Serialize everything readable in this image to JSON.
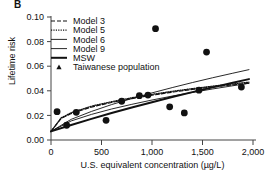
{
  "panel": {
    "label": "B"
  },
  "axes": {
    "ylabel": "Lifetime risk",
    "xlabel": "U.S. equivalent concentration (µg/L)",
    "yticks": [
      "0.00",
      "0.02",
      "0.04",
      "0.06",
      "0.08",
      "0.10"
    ],
    "xticks": [
      "0",
      "500",
      "1,000",
      "1,500",
      "2,000"
    ]
  },
  "legend": {
    "items": [
      {
        "label": "Model 3",
        "style": "dashed"
      },
      {
        "label": "Model 5",
        "style": "dotted"
      },
      {
        "label": "Model 6",
        "style": "thin-solid"
      },
      {
        "label": "Model 9",
        "style": "thin-solid"
      },
      {
        "label": "MSW",
        "style": "thick-solid"
      },
      {
        "label": "Taiwanese population",
        "style": "marker-triangle"
      }
    ]
  },
  "chart_data": {
    "type": "scatter",
    "title": "B",
    "xlabel": "U.S. equivalent concentration (µg/L)",
    "ylabel": "Lifetime risk",
    "xlim": [
      0,
      2000
    ],
    "ylim": [
      0.0,
      0.1
    ],
    "xticks": [
      0,
      500,
      1000,
      1500,
      2000
    ],
    "yticks": [
      0.0,
      0.02,
      0.04,
      0.06,
      0.08,
      0.1
    ],
    "grid": false,
    "legend_position": "upper-left",
    "scatter": {
      "name": "Taiwanese population",
      "marker": "circle",
      "color": "#111111",
      "points": [
        {
          "x": 60,
          "y": 0.023
        },
        {
          "x": 155,
          "y": 0.012
        },
        {
          "x": 250,
          "y": 0.0225
        },
        {
          "x": 545,
          "y": 0.016
        },
        {
          "x": 700,
          "y": 0.0315
        },
        {
          "x": 875,
          "y": 0.036
        },
        {
          "x": 960,
          "y": 0.0365
        },
        {
          "x": 1035,
          "y": 0.0905
        },
        {
          "x": 1175,
          "y": 0.027
        },
        {
          "x": 1320,
          "y": 0.022
        },
        {
          "x": 1465,
          "y": 0.0405
        },
        {
          "x": 1540,
          "y": 0.0715
        },
        {
          "x": 1885,
          "y": 0.043
        }
      ]
    },
    "series": [
      {
        "name": "Model 3",
        "style": "dashed",
        "width": 1.2,
        "x": [
          0,
          100,
          200,
          400,
          600,
          800,
          1000,
          1200,
          1400,
          1600,
          1800,
          1960
        ],
        "y": [
          0.007,
          0.0175,
          0.0215,
          0.0268,
          0.0305,
          0.0337,
          0.0364,
          0.0389,
          0.0411,
          0.0431,
          0.0448,
          0.0462
        ]
      },
      {
        "name": "Model 5",
        "style": "dotted",
        "width": 1.2,
        "x": [
          0,
          100,
          200,
          400,
          600,
          800,
          1000,
          1200,
          1400,
          1600,
          1800,
          1960
        ],
        "y": [
          0.007,
          0.018,
          0.0222,
          0.0275,
          0.0312,
          0.0344,
          0.0371,
          0.0396,
          0.0418,
          0.0438,
          0.0456,
          0.047
        ]
      },
      {
        "name": "Model 6",
        "style": "thin-solid",
        "width": 0.9,
        "x": [
          0,
          200,
          400,
          600,
          800,
          1000,
          1200,
          1400,
          1600,
          1800,
          1960
        ],
        "y": [
          0.007,
          0.0155,
          0.0208,
          0.0252,
          0.029,
          0.0325,
          0.0357,
          0.0387,
          0.0415,
          0.0441,
          0.0461
        ]
      },
      {
        "name": "Model 9",
        "style": "thin-solid",
        "width": 0.9,
        "x": [
          0,
          200,
          400,
          600,
          800,
          1000,
          1200,
          1400,
          1600,
          1800,
          1960
        ],
        "y": [
          0.007,
          0.0168,
          0.0232,
          0.0288,
          0.0337,
          0.0383,
          0.0426,
          0.0467,
          0.0506,
          0.0543,
          0.0572
        ]
      },
      {
        "name": "MSW",
        "style": "thick-solid",
        "width": 2.0,
        "x": [
          0,
          200,
          400,
          600,
          800,
          1000,
          1200,
          1400,
          1600,
          1800,
          1960
        ],
        "y": [
          0.007,
          0.0122,
          0.0172,
          0.0219,
          0.0264,
          0.0307,
          0.0349,
          0.0389,
          0.0428,
          0.0466,
          0.0495
        ]
      }
    ]
  }
}
